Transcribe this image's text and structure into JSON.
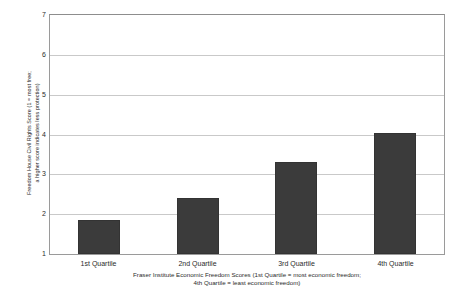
{
  "chart_data": {
    "type": "bar",
    "title": "",
    "categories": [
      "1st Quartile",
      "2nd Quartile",
      "3rd Quartile",
      "4th Quartile"
    ],
    "values": [
      1.85,
      2.4,
      3.3,
      4.05
    ],
    "series": [
      {
        "name": "Freedom House Civil Rights Score",
        "values": [
          1.85,
          2.4,
          3.3,
          4.05
        ]
      }
    ],
    "xlabel": "Fraser Institute Economic Freedom Scores (1st Quartile = most economic freedom;\n4th Quartile = least economic freedom)",
    "ylabel": "Freedom House Civil Rights Score (1 = most free;\na higher score indicates less protection)",
    "ylim": [
      1,
      7
    ],
    "yticks": [
      1,
      2,
      3,
      4,
      5,
      6,
      7
    ],
    "ytick_labels": [
      "1",
      "2",
      "3",
      "4",
      "5",
      "6",
      "7"
    ],
    "grid": true,
    "grid_axis": "y",
    "legend": false,
    "legend_position": "none",
    "bar_color": "#3b3b3b",
    "grid_color": "#c9c9c9",
    "axis_color": "#9a9a9a",
    "background_color": "#ffffff"
  }
}
